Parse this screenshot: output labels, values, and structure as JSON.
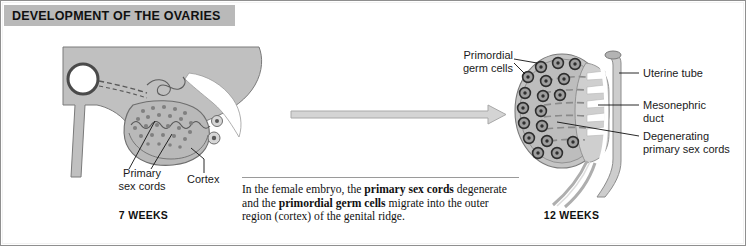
{
  "figure": {
    "title": "DEVELOPMENT OF THE OVARIES",
    "title_bar_color": "#b9b9b9",
    "background": "#ffffff",
    "border_color": "#8f8f8f"
  },
  "panels": [
    {
      "id": "seven-weeks",
      "stage_label": "7 WEEKS",
      "labels": [
        {
          "key": "primary_sex_cords",
          "text_line1": "Primary",
          "text_line2": "sex cords"
        },
        {
          "key": "cortex",
          "text_line1": "Cortex"
        }
      ]
    },
    {
      "id": "twelve-weeks",
      "stage_label": "12 WEEKS",
      "labels": [
        {
          "key": "primordial_germ_cells",
          "text_line1": "Primordial",
          "text_line2": "germ cells"
        },
        {
          "key": "uterine_tube",
          "text_line1": "Uterine tube"
        },
        {
          "key": "mesonephric_duct",
          "text_line1": "Mesonephric",
          "text_line2": "duct"
        },
        {
          "key": "degenerating_primary_sex_cords",
          "text_line1": "Degenerating",
          "text_line2": "primary sex cords"
        }
      ]
    }
  ],
  "arrow": {
    "name": "progression-arrow",
    "direction": "right"
  },
  "caption": {
    "part1": "In the female embryo, the ",
    "bold1": "primary sex cords",
    "part2": " degenerate and the ",
    "bold2": "primordial germ cells",
    "part3": " migrate into the outer region (cortex) of the genital ridge."
  },
  "colors": {
    "tissue_fill": "#c0c0c0",
    "tissue_stroke": "#6e6e6e",
    "gonad_fill": "#b5b5b5",
    "cell_fill": "#9a9a9a",
    "cell_ring": "#3c3c3c",
    "arrow_fill": "#d4d4d4",
    "arrow_stroke": "#a8a8a8",
    "leader_line": "#111111"
  }
}
